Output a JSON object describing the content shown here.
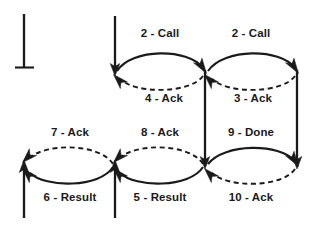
{
  "diagram": {
    "type": "message-sequence",
    "colors": {
      "stroke": "#1a1a1a",
      "background": "#ffffff",
      "label_text": "#1a1a1a"
    },
    "labels": {
      "call_left": "2 - Call",
      "call_right": "2 - Call",
      "ack_4": "4 - Ack",
      "ack_3": "3 - Ack",
      "ack_7": "7 - Ack",
      "ack_8": "8 - Ack",
      "done_9": "9 - Done",
      "result_6": "6 - Result",
      "result_5": "5 - Result",
      "ack_10": "10 - Ack"
    },
    "nodes": [
      {
        "name": "start-terminal",
        "x": 24,
        "y": 14,
        "style": "bar-foot"
      },
      {
        "name": "node-top-left",
        "x": 115,
        "y": 72
      },
      {
        "name": "node-top-mid",
        "x": 205,
        "y": 72
      },
      {
        "name": "node-top-right",
        "x": 297,
        "y": 72
      },
      {
        "name": "node-bottom-left",
        "x": 24,
        "y": 165
      },
      {
        "name": "node-bottom-mid",
        "x": 115,
        "y": 165
      },
      {
        "name": "node-bottom-midright",
        "x": 205,
        "y": 165
      },
      {
        "name": "node-bottom-right",
        "x": 297,
        "y": 165
      }
    ],
    "edges": [
      {
        "name": "edge-2-call-left",
        "label": "2 - Call",
        "style": "solid",
        "direction": "rightward",
        "from": "node-top-left",
        "to": "node-top-mid"
      },
      {
        "name": "edge-2-call-right",
        "label": "2 - Call",
        "style": "solid",
        "direction": "rightward",
        "from": "node-top-mid",
        "to": "node-top-right"
      },
      {
        "name": "edge-4-ack",
        "label": "4 - Ack",
        "style": "dashed",
        "direction": "leftward",
        "from": "node-top-mid",
        "to": "node-top-left"
      },
      {
        "name": "edge-3-ack",
        "label": "3 - Ack",
        "style": "dashed",
        "direction": "leftward",
        "from": "node-top-right",
        "to": "node-top-mid"
      },
      {
        "name": "edge-7-ack",
        "label": "7 - Ack",
        "style": "dashed",
        "direction": "leftward",
        "from": "node-bottom-mid",
        "to": "node-bottom-left"
      },
      {
        "name": "edge-8-ack",
        "label": "8 - Ack",
        "style": "dashed",
        "direction": "leftward",
        "from": "node-bottom-midright",
        "to": "node-bottom-mid"
      },
      {
        "name": "edge-9-done",
        "label": "9 - Done",
        "style": "solid",
        "direction": "rightward",
        "from": "node-bottom-midright",
        "to": "node-bottom-right"
      },
      {
        "name": "edge-6-result",
        "label": "6 - Result",
        "style": "solid",
        "direction": "leftward",
        "from": "node-bottom-mid",
        "to": "node-bottom-left"
      },
      {
        "name": "edge-5-result",
        "label": "5 - Result",
        "style": "solid",
        "direction": "leftward",
        "from": "node-bottom-midright",
        "to": "node-bottom-mid"
      },
      {
        "name": "edge-10-ack",
        "label": "10 - Ack",
        "style": "dashed",
        "direction": "leftward",
        "from": "node-bottom-right",
        "to": "node-bottom-midright"
      }
    ],
    "lifelines": [
      {
        "name": "lifeline-start",
        "x": 24,
        "y1": 14,
        "y2": 67,
        "arrow": "none"
      },
      {
        "name": "lifeline-top-left",
        "x": 115,
        "y1": 16,
        "y2": 72,
        "arrow": "down"
      },
      {
        "name": "lifeline-mid-vertical",
        "x": 205,
        "y1": 72,
        "y2": 165,
        "arrow": "down"
      },
      {
        "name": "lifeline-right-vertical",
        "x": 297,
        "y1": 72,
        "y2": 165,
        "arrow": "down"
      },
      {
        "name": "lifeline-bottom-left",
        "x": 24,
        "y1": 165,
        "y2": 218,
        "arrow": "up"
      },
      {
        "name": "lifeline-bottom-mid",
        "x": 115,
        "y1": 165,
        "y2": 218,
        "arrow": "up"
      }
    ],
    "label_positions": {
      "call_left": {
        "x": 160,
        "y": 34
      },
      "call_right": {
        "x": 251,
        "y": 34
      },
      "ack_4": {
        "x": 164,
        "y": 99
      },
      "ack_3": {
        "x": 253,
        "y": 99
      },
      "ack_7": {
        "x": 70,
        "y": 133
      },
      "ack_8": {
        "x": 160,
        "y": 133
      },
      "done_9": {
        "x": 251,
        "y": 133
      },
      "result_6": {
        "x": 70,
        "y": 198
      },
      "result_5": {
        "x": 160,
        "y": 198
      },
      "ack_10": {
        "x": 251,
        "y": 198
      }
    }
  }
}
